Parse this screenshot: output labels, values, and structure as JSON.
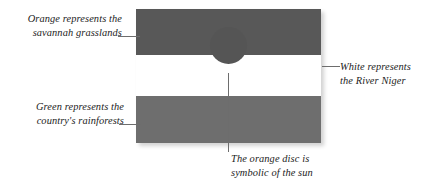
{
  "figure": {
    "colors": {
      "orange_band": "#585858",
      "white_band": "#ffffff",
      "green_band": "#6e6e6e",
      "disc": "#555555",
      "leader_line": "#6d6d6d",
      "text": "#1c1c1c",
      "background": "#ffffff"
    }
  },
  "annotations": {
    "top_left": {
      "line1": "Orange represents the",
      "line2": "savannah grasslands"
    },
    "right": {
      "line1": "White represents",
      "line2": "the River Niger"
    },
    "bottom_left": {
      "line1": "Green represents the",
      "line2": "country's rainforests"
    },
    "bottom": {
      "line1": "The orange disc is",
      "line2": "symbolic of the sun"
    }
  }
}
